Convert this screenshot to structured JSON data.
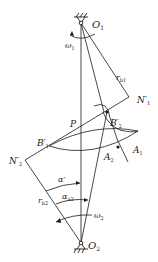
{
  "diagram": {
    "colors": {
      "line": "#1a1a1a",
      "background": "#ffffff"
    },
    "labels": {
      "O1": {
        "main": "O",
        "sub": "1"
      },
      "O2": {
        "main": "O",
        "sub": "2"
      },
      "omega1": {
        "main": "ω",
        "sub": "1"
      },
      "omega2": {
        "main": "ω",
        "sub": "2"
      },
      "rb1": {
        "main": "r",
        "sub": "b1"
      },
      "rb2": {
        "main": "r",
        "sub": "b2"
      },
      "N1p": {
        "main": "N′",
        "sub": "1"
      },
      "N2p": {
        "main": "N′",
        "sub": "2"
      },
      "P": {
        "main": "P"
      },
      "B1p": {
        "main": "B′",
        "sub": "1"
      },
      "B2p": {
        "main": "B′",
        "sub": "2"
      },
      "A1": {
        "main": "A",
        "sub": "1"
      },
      "A2": {
        "main": "A",
        "sub": "2"
      },
      "alpha_prime": {
        "main": "α′"
      },
      "alpha_a2": {
        "main": "α",
        "sub": "a2"
      }
    },
    "points": {
      "O1": [
        81,
        23
      ],
      "O2": [
        81,
        243
      ],
      "P": [
        81,
        127
      ],
      "N1p": [
        129,
        97
      ],
      "N2p": [
        25,
        160
      ],
      "B1p": [
        49,
        146
      ],
      "B2p": [
        107,
        112
      ],
      "A1": [
        138,
        131
      ],
      "A2": [
        118,
        147
      ]
    }
  }
}
